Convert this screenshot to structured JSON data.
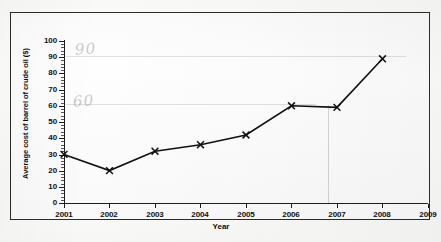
{
  "chart_data": {
    "type": "line",
    "title": "",
    "xlabel": "Year",
    "ylabel": "Average cost of barrel of crude oil ($)",
    "x": [
      2001,
      2002,
      2003,
      2004,
      2005,
      2006,
      2007,
      2008
    ],
    "values": [
      30,
      20,
      32,
      36,
      42,
      60,
      59,
      89
    ],
    "categories": [
      "2001",
      "2002",
      "2003",
      "2004",
      "2005",
      "2006",
      "2007",
      "2008"
    ],
    "xlim": [
      2001,
      2009
    ],
    "ylim": [
      0,
      100
    ],
    "y_ticks": [
      0,
      10,
      20,
      30,
      40,
      50,
      60,
      70,
      80,
      90,
      100
    ],
    "x_ticks": [
      "2001",
      "2002",
      "2003",
      "2004",
      "2005",
      "2006",
      "2007",
      "2008",
      "2009"
    ],
    "grid": false,
    "legend": "none",
    "marker": "x",
    "line_color": "#111111",
    "series": [
      {
        "name": "Average cost of barrel of crude oil ($)",
        "values": [
          30,
          20,
          32,
          36,
          42,
          60,
          59,
          89
        ]
      }
    ]
  },
  "axes": {
    "y_title": "Average cost of barrel of crude oil ($)",
    "x_title": "Year",
    "y_tick_labels": [
      "100",
      "90",
      "80",
      "70",
      "60",
      "50",
      "40",
      "30",
      "20",
      "10",
      "0"
    ],
    "x_tick_labels": [
      "2001",
      "2002",
      "2003",
      "2004",
      "2005",
      "2006",
      "2007",
      "2008",
      "2009"
    ]
  },
  "annotations": {
    "pencil_90": "90",
    "pencil_60": "60"
  },
  "colors": {
    "line": "#111111",
    "axis": "#1d1d1d",
    "frame": "#2c2c2c",
    "pencil": "#7a7c80",
    "page": "#fdfdfc"
  }
}
